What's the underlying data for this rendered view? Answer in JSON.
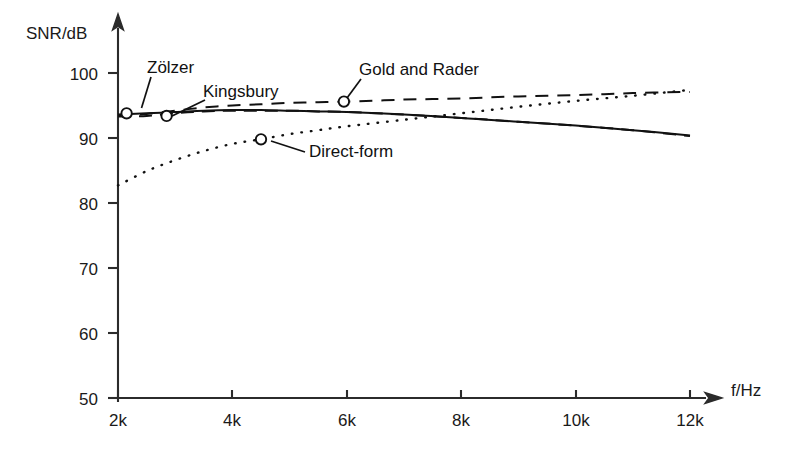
{
  "chart_data": {
    "type": "line",
    "title": "",
    "xlabel": "f/Hz",
    "ylabel": "SNR/dB",
    "xlim": [
      2000,
      12000
    ],
    "ylim": [
      50,
      100
    ],
    "grid": false,
    "legend_position": "inline-annotations",
    "xticks": [
      2000,
      4000,
      6000,
      8000,
      10000,
      12000
    ],
    "xtick_labels": [
      "2k",
      "4k",
      "6k",
      "8k",
      "10k",
      "12k"
    ],
    "yticks": [
      50,
      60,
      70,
      80,
      90,
      100
    ],
    "ytick_labels": [
      "50",
      "60",
      "70",
      "80",
      "90",
      "100"
    ],
    "x": [
      2000,
      2500,
      3000,
      3500,
      4000,
      4500,
      5000,
      5500,
      6000,
      7000,
      8000,
      9000,
      10000,
      11000,
      12000
    ],
    "series": [
      {
        "name": "Zölzer",
        "style": "solid",
        "marker_point": {
          "x": 2150,
          "y": 93.8
        },
        "label_position": {
          "x": 2560,
          "y": 100.4
        },
        "values": [
          93.6,
          93.8,
          94.0,
          94.2,
          94.3,
          94.3,
          94.2,
          94.1,
          94.0,
          93.6,
          93.1,
          92.5,
          91.9,
          91.2,
          90.4
        ]
      },
      {
        "name": "Kingsbury",
        "style": "dashed",
        "marker_point": {
          "x": 2850,
          "y": 93.4
        },
        "label_position": {
          "x": 3540,
          "y": 96.8
        },
        "values": [
          93.3,
          93.4,
          93.8,
          94.1,
          94.2,
          94.2,
          94.2,
          94.1,
          94.0,
          93.6,
          93.1,
          92.5,
          91.9,
          91.2,
          90.3
        ]
      },
      {
        "name": "Gold and Rader",
        "style": "dashed",
        "marker_point": {
          "x": 5950,
          "y": 95.6
        },
        "label_position": {
          "x": 6280,
          "y": 100.6
        },
        "values": [
          93.4,
          93.7,
          94.2,
          94.7,
          95.0,
          95.2,
          95.4,
          95.5,
          95.6,
          95.9,
          96.1,
          96.4,
          96.6,
          96.9,
          97.1
        ]
      },
      {
        "name": "Direct-form",
        "style": "dotted",
        "marker_point": {
          "x": 4500,
          "y": 89.8
        },
        "label_position": {
          "x": 5380,
          "y": 88.4
        },
        "values": [
          82.7,
          84.9,
          86.6,
          88.0,
          89.1,
          89.8,
          90.6,
          91.2,
          91.8,
          92.8,
          93.8,
          94.8,
          95.7,
          96.5,
          97.4
        ]
      }
    ],
    "annotations": [
      {
        "text": "Zölzer",
        "target_series": "Zölzer"
      },
      {
        "text": "Kingsbury",
        "target_series": "Kingsbury"
      },
      {
        "text": "Gold and Rader",
        "target_series": "Gold and Rader"
      },
      {
        "text": "Direct-form",
        "target_series": "Direct-form"
      }
    ],
    "colors": {
      "foreground": "#111111",
      "axis": "#2b2b2b",
      "background": "#ffffff"
    }
  }
}
